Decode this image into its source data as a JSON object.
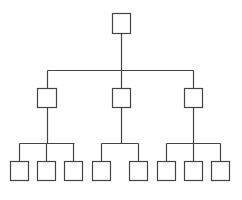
{
  "diagram": {
    "type": "org-chart-tree",
    "stroke_color": "#444444",
    "background": "#ffffff",
    "levels": 3,
    "root": {
      "x": 112,
      "y": 13,
      "w": 18,
      "h": 20
    },
    "trunk": {
      "x": 121,
      "y1": 33,
      "y2": 70
    },
    "branch_top": {
      "x1": 47,
      "x2": 193,
      "y": 70
    },
    "middle": [
      {
        "x": 37,
        "y": 88,
        "w": 19,
        "h": 19,
        "cx": 47
      },
      {
        "x": 112,
        "y": 88,
        "w": 18,
        "h": 19,
        "cx": 121
      },
      {
        "x": 184,
        "y": 88,
        "w": 18,
        "h": 19,
        "cx": 193
      }
    ],
    "branch_bottom": [
      {
        "x1": 19,
        "x2": 74,
        "y": 143,
        "from_x": 47
      },
      {
        "x1": 101,
        "x2": 138,
        "y": 143,
        "from_x": 121
      },
      {
        "x1": 166,
        "x2": 220,
        "y": 143,
        "from_x": 193
      }
    ],
    "leaves": [
      {
        "x": 10,
        "y": 161,
        "w": 18,
        "h": 19
      },
      {
        "x": 37,
        "y": 161,
        "w": 18,
        "h": 19
      },
      {
        "x": 64,
        "y": 161,
        "w": 18,
        "h": 19
      },
      {
        "x": 92,
        "y": 161,
        "w": 18,
        "h": 19
      },
      {
        "x": 129,
        "y": 161,
        "w": 18,
        "h": 19
      },
      {
        "x": 157,
        "y": 161,
        "w": 18,
        "h": 19
      },
      {
        "x": 184,
        "y": 161,
        "w": 18,
        "h": 19
      },
      {
        "x": 211,
        "y": 161,
        "w": 18,
        "h": 19
      }
    ]
  }
}
